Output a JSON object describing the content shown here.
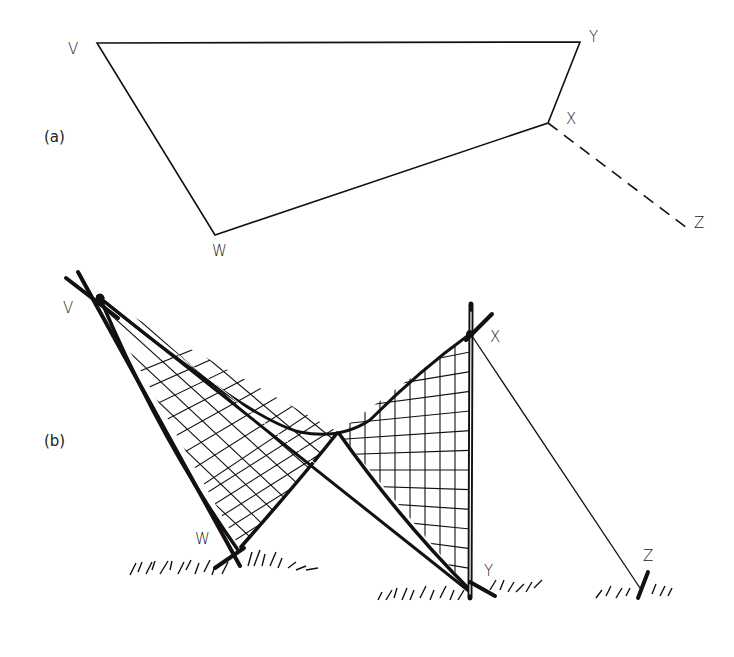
{
  "figure": {
    "panel_a": {
      "label": "(a)",
      "points": {
        "V": {
          "label": "V",
          "x": 97,
          "y": 43
        },
        "Y": {
          "label": "Y",
          "x": 580,
          "y": 42
        },
        "X": {
          "label": "X",
          "x": 548,
          "y": 123
        },
        "W": {
          "label": "W",
          "x": 215,
          "y": 235
        },
        "Z": {
          "label": "Z",
          "x": 687,
          "y": 228
        }
      },
      "edges_solid": [
        "V-Y",
        "Y-X",
        "X-W",
        "W-V"
      ],
      "edges_dashed": [
        "X-Z"
      ]
    },
    "panel_b": {
      "label": "(b)",
      "description": "Hyperbolic paraboloid net sketch supported by crossed poles at V and X, guy line from X to ground stake Z",
      "points": {
        "V": {
          "label": "V"
        },
        "W": {
          "label": "W"
        },
        "X": {
          "label": "X"
        },
        "Y": {
          "label": "Y"
        },
        "Z": {
          "label": "Z"
        }
      }
    },
    "line_color": "#111111",
    "background": "#ffffff"
  }
}
